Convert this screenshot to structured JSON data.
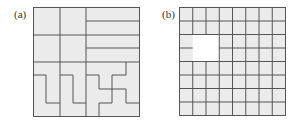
{
  "figure": {
    "panels": [
      {
        "label": "(a)",
        "description": "Square divided into regions: top two rows have two square cells plus a column of horizontal strips; bottom row has interlocking staircase/zigzag pieces"
      },
      {
        "label": "(b)",
        "description": "8x8 grid of squares with a 2x2 missing (white) block",
        "grid_size": 8,
        "hole": {
          "col_start": 1,
          "row_start": 2,
          "cols": 2,
          "rows": 2
        }
      }
    ]
  },
  "colors": {
    "fill": "#ebebeb",
    "line": "#555555",
    "hole": "#ffffff"
  }
}
